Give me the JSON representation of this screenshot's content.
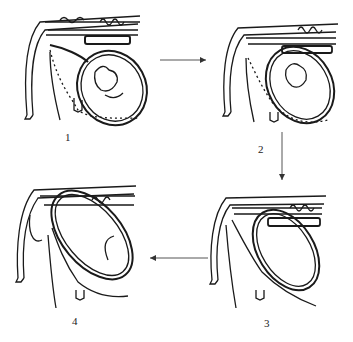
{
  "diagram": {
    "type": "sequence-illustration",
    "panels": [
      {
        "id": 1,
        "label": "1"
      },
      {
        "id": 2,
        "label": "2"
      },
      {
        "id": 3,
        "label": "3"
      },
      {
        "id": 4,
        "label": "4"
      }
    ],
    "flow": [
      "1 → 2",
      "2 → 3",
      "3 → 4"
    ],
    "arrows": [
      {
        "from": "1",
        "to": "2",
        "direction": "right"
      },
      {
        "from": "2",
        "to": "3",
        "direction": "down"
      },
      {
        "from": "3",
        "to": "4",
        "direction": "left"
      }
    ],
    "colors": {
      "ink": "#1a1a1a",
      "arrow": "#555555",
      "background": "#ffffff"
    }
  }
}
